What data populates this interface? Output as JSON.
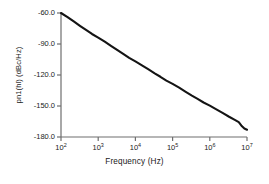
{
  "chart_data": {
    "type": "line",
    "title": "",
    "xlabel": "Frequency (Hz)",
    "ylabel": "pn1(hl) (dBc/Hz)",
    "xscale": "log",
    "yscale": "linear",
    "xlim": [
      100,
      10000000
    ],
    "ylim": [
      -180,
      -60
    ],
    "grid": false,
    "legend": null,
    "xtick_labels": [
      "10²",
      "10³",
      "10⁴",
      "10⁵",
      "10⁶",
      "10⁷"
    ],
    "xtick_mantissas": [
      "10",
      "10",
      "10",
      "10",
      "10",
      "10"
    ],
    "xtick_exponents": [
      "2",
      "3",
      "4",
      "5",
      "6",
      "7"
    ],
    "xtick_values": [
      100,
      1000,
      10000,
      100000,
      1000000,
      10000000
    ],
    "ytick_labels": [
      "-60.0",
      "-90.0",
      "-120.0",
      "-150.0",
      "-180.0"
    ],
    "ytick_values": [
      -60,
      -90,
      -120,
      -150,
      -180
    ],
    "series": [
      {
        "name": "pn1(hl)",
        "color": "#141414",
        "x": [
          100,
          150,
          220,
          330,
          470,
          680,
          1000,
          1500,
          2200,
          3300,
          4700,
          6800,
          10000,
          15000,
          22000,
          33000,
          47000,
          68000,
          100000,
          150000,
          220000,
          330000,
          470000,
          680000,
          1000000,
          1500000,
          2200000,
          3300000,
          4700000,
          6000000,
          7000000,
          8500000,
          10000000
        ],
        "y": [
          -60.0,
          -64.0,
          -68.2,
          -72.6,
          -76.3,
          -80.3,
          -83.8,
          -87.8,
          -91.8,
          -96.0,
          -99.5,
          -103.4,
          -106.8,
          -110.6,
          -114.4,
          -118.4,
          -121.7,
          -125.4,
          -128.6,
          -132.3,
          -136.0,
          -139.9,
          -143.1,
          -146.6,
          -149.6,
          -153.2,
          -156.7,
          -160.4,
          -163.4,
          -165.6,
          -168.8,
          -171.8,
          -173.0
        ]
      }
    ]
  },
  "axes": {
    "left_px": 61,
    "right_px": 247,
    "top_px": 13,
    "bottom_px": 137,
    "spine_color": "#6e6e6e",
    "tick_length_px": 4,
    "line_width_px": 2.1
  },
  "figure": {
    "background": "#ffffff",
    "width_px": 269,
    "height_px": 184
  }
}
